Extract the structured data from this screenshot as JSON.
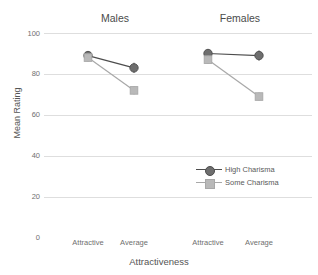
{
  "chart_data": {
    "type": "line",
    "title": "",
    "xlabel": "Attractiveness",
    "ylabel": "Mean Rating",
    "ylim": [
      0,
      100
    ],
    "yticks": [
      100,
      80,
      60,
      40,
      20,
      0
    ],
    "grid": true,
    "legend_position": "inside lower-right",
    "facet_titles": [
      "Males",
      "Females"
    ],
    "categories": [
      "Attractive",
      "Average"
    ],
    "panels": [
      {
        "name": "Males",
        "series": [
          {
            "name": "High Charisma",
            "values": [
              89,
              83
            ],
            "errors": [
              2.0,
              2.5
            ]
          },
          {
            "name": "Some Charisma",
            "values": [
              88,
              72
            ],
            "errors": [
              2.0,
              2.0
            ]
          }
        ]
      },
      {
        "name": "Females",
        "series": [
          {
            "name": "High Charisma",
            "values": [
              90,
              89
            ],
            "errors": [
              2.0,
              2.5
            ]
          },
          {
            "name": "Some Charisma",
            "values": [
              87,
              69
            ],
            "errors": [
              2.0,
              2.0
            ]
          }
        ]
      }
    ],
    "legend": [
      {
        "label": "High Charisma",
        "color": "#6e6e6e",
        "line_color": "#4d4d4d",
        "marker": "circle"
      },
      {
        "label": "Some Charisma",
        "color": "#b9b9b9",
        "line_color": "#a8a8a8",
        "marker": "square"
      }
    ],
    "colors": {
      "high_charisma_marker": "#6e6e6e",
      "high_charisma_line": "#4d4d4d",
      "some_charisma_marker": "#b9b9b9",
      "some_charisma_line": "#a8a8a8",
      "gridline": "#dedede",
      "text": "#5a5a5a",
      "background": "#ffffff"
    }
  },
  "axes": {
    "y_tick_labels": [
      "100",
      "80",
      "60",
      "40",
      "20",
      "0"
    ],
    "x_tick_labels": [
      "Attractive",
      "Average",
      "Attractive",
      "Average"
    ],
    "y_axis_title": "Mean Rating",
    "x_axis_title": "Attractiveness"
  },
  "panels": {
    "left_title": "Males",
    "right_title": "Females"
  },
  "legend": {
    "high_label": "High Charisma",
    "some_label": "Some Charisma"
  }
}
